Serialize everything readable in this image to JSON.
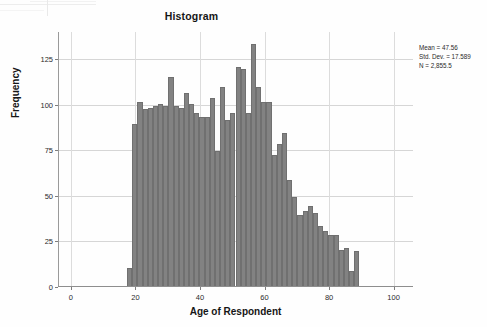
{
  "chart_data": {
    "type": "bar",
    "title": "Histogram",
    "xlabel": "Age of Respondent",
    "ylabel": "Frequency",
    "xlim": [
      -4,
      106
    ],
    "ylim": [
      0,
      140
    ],
    "xticks": [
      0,
      20,
      40,
      60,
      80,
      100
    ],
    "yticks": [
      0,
      25,
      50,
      75,
      100,
      125
    ],
    "grid": true,
    "legend": null,
    "bar_color": "#828282",
    "bin_width": 1.6,
    "categories": [
      18.2,
      19.8,
      21.4,
      23.0,
      24.6,
      26.2,
      27.8,
      29.4,
      31.0,
      32.6,
      34.2,
      35.8,
      37.4,
      39.0,
      40.6,
      42.2,
      43.8,
      45.4,
      47.0,
      48.6,
      50.2,
      51.8,
      53.4,
      55.0,
      56.6,
      58.2,
      59.8,
      61.4,
      63.0,
      64.6,
      66.2,
      67.8,
      69.4,
      71.0,
      72.6,
      74.2,
      75.8,
      77.4,
      79.0,
      80.6,
      82.2,
      83.8,
      85.4,
      87.0,
      88.6,
      90.2
    ],
    "values": [
      10,
      89,
      101,
      97,
      98,
      99,
      100,
      99,
      115,
      99,
      98,
      106,
      100,
      95,
      93,
      93,
      103,
      74,
      109,
      91,
      95,
      120,
      119,
      95,
      133,
      109,
      101,
      101,
      72,
      78,
      84,
      58,
      49,
      39,
      41,
      44,
      40,
      33,
      30,
      28,
      28,
      20,
      21,
      8,
      19,
      0
    ],
    "annotations": [
      "Mean = 47.56",
      "Std. Dev. = 17.589",
      "N = 2,855.5"
    ]
  },
  "stats": {
    "mean": "Mean = 47.56",
    "std_dev": "Std. Dev. = 17.589",
    "n": "N = 2,855.5"
  }
}
